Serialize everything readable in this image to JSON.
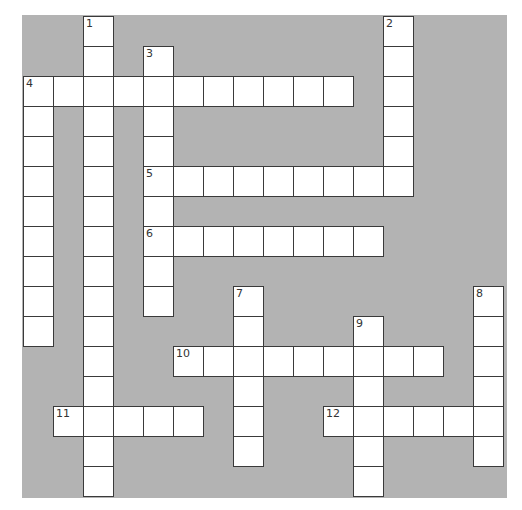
{
  "puzzle": {
    "cell_size": 30,
    "origin": {
      "x": 23,
      "y": 16
    },
    "colors": {
      "background": "#b3b3b3",
      "cell": "#ffffff",
      "border": "#3a3a3a",
      "number": "#333333"
    },
    "entries": [
      {
        "number": "1",
        "direction": "down",
        "row": 0,
        "col": 2,
        "length": 16
      },
      {
        "number": "2",
        "direction": "down",
        "row": 0,
        "col": 12,
        "length": 6
      },
      {
        "number": "3",
        "direction": "down",
        "row": 1,
        "col": 4,
        "length": 9
      },
      {
        "number": "4",
        "direction": "across",
        "row": 2,
        "col": 0,
        "length": 11
      },
      {
        "number": "4",
        "direction": "down",
        "row": 2,
        "col": 0,
        "length": 9
      },
      {
        "number": "5",
        "direction": "across",
        "row": 5,
        "col": 4,
        "length": 9
      },
      {
        "number": "6",
        "direction": "across",
        "row": 7,
        "col": 4,
        "length": 8
      },
      {
        "number": "7",
        "direction": "down",
        "row": 9,
        "col": 7,
        "length": 6
      },
      {
        "number": "8",
        "direction": "down",
        "row": 9,
        "col": 15,
        "length": 6
      },
      {
        "number": "9",
        "direction": "down",
        "row": 10,
        "col": 11,
        "length": 6
      },
      {
        "number": "10",
        "direction": "across",
        "row": 11,
        "col": 5,
        "length": 9
      },
      {
        "number": "11",
        "direction": "across",
        "row": 13,
        "col": 1,
        "length": 5
      },
      {
        "number": "12",
        "direction": "across",
        "row": 13,
        "col": 10,
        "length": 6
      }
    ]
  }
}
